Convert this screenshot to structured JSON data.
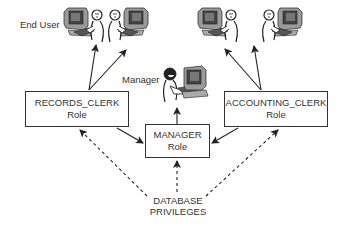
{
  "diagram": {
    "labels": {
      "end_user": "End User",
      "manager": "Manager"
    },
    "roles": [
      {
        "name": "RECORDS_CLERK",
        "suffix": "Role"
      },
      {
        "name": "MANAGER",
        "suffix": "Role"
      },
      {
        "name": "ACCOUNTING_CLERK",
        "suffix": "Role"
      }
    ],
    "privileges": {
      "line1": "DATABASE",
      "line2": "PRIVILEGES"
    },
    "icons": [
      "end-user-workstation-icon",
      "end-user-workstation-icon",
      "end-user-workstation-icon",
      "end-user-workstation-icon",
      "manager-workstation-icon"
    ],
    "edges": [
      {
        "from": "RECORDS_CLERK Role",
        "to": "End User 1",
        "style": "solid"
      },
      {
        "from": "RECORDS_CLERK Role",
        "to": "End User 2",
        "style": "solid"
      },
      {
        "from": "ACCOUNTING_CLERK Role",
        "to": "End User 3",
        "style": "solid"
      },
      {
        "from": "ACCOUNTING_CLERK Role",
        "to": "End User 4",
        "style": "solid"
      },
      {
        "from": "RECORDS_CLERK Role",
        "to": "MANAGER Role",
        "style": "solid"
      },
      {
        "from": "ACCOUNTING_CLERK Role",
        "to": "MANAGER Role",
        "style": "solid"
      },
      {
        "from": "MANAGER Role",
        "to": "Manager",
        "style": "solid"
      },
      {
        "from": "DATABASE PRIVILEGES",
        "to": "RECORDS_CLERK Role",
        "style": "dashed"
      },
      {
        "from": "DATABASE PRIVILEGES",
        "to": "MANAGER Role",
        "style": "dashed"
      },
      {
        "from": "DATABASE PRIVILEGES",
        "to": "ACCOUNTING_CLERK Role",
        "style": "dashed"
      }
    ]
  }
}
